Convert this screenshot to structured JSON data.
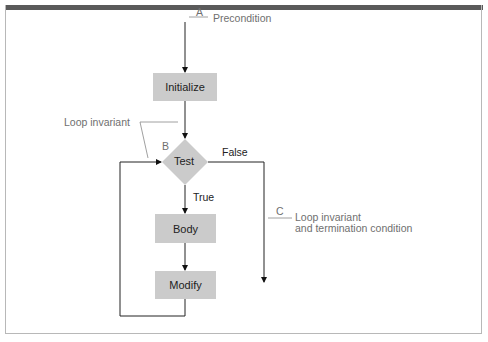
{
  "diagram": {
    "type": "flowchart",
    "nodes": {
      "initialize": "Initialize",
      "test": "Test",
      "body": "Body",
      "modify": "Modify"
    },
    "edges": {
      "true_label": "True",
      "false_label": "False"
    },
    "annotations": {
      "a_marker": "A",
      "a_text": "Precondition",
      "b_marker": "B",
      "b_text": "Loop invariant",
      "c_marker": "C",
      "c_text_line1": "Loop invariant",
      "c_text_line2": "and termination condition"
    },
    "colors": {
      "node_fill": "#cbcbcb",
      "top_bar": "#5a5a5a",
      "annotation_text": "#6f6f6f"
    }
  }
}
